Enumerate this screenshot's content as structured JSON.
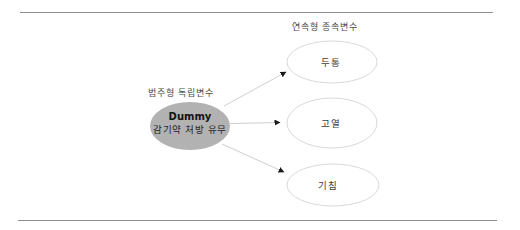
{
  "diagram": {
    "independent": {
      "group_label": "범주형 독립변수",
      "node": {
        "title": "Dummy",
        "subtitle": "감기약 처방 유무"
      }
    },
    "dependent": {
      "group_label": "연속형 종속변수",
      "nodes": [
        {
          "label": "두통"
        },
        {
          "label": "고열"
        },
        {
          "label": "기침"
        }
      ]
    },
    "colors": {
      "independent_fill": "#b2b2b2",
      "dependent_fill": "#ffffff",
      "dependent_stroke": "#d9d9d9",
      "arrow_line": "#cfcfcf",
      "arrowhead": "#1a1a1a",
      "rule": "#8f8f8f"
    }
  }
}
